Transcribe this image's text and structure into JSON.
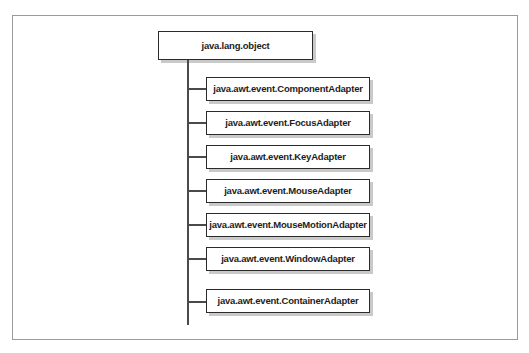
{
  "diagram": {
    "type": "class-hierarchy-tree",
    "root": {
      "label": "java.lang.object"
    },
    "children": [
      {
        "label": "java.awt.event.ComponentAdapter"
      },
      {
        "label": "java.awt.event.FocusAdapter"
      },
      {
        "label": "java.awt.event.KeyAdapter"
      },
      {
        "label": "java.awt.event.MouseAdapter"
      },
      {
        "label": "java.awt.event.MouseMotionAdapter"
      },
      {
        "label": "java.awt.event.WindowAdapter"
      },
      {
        "label": "java.awt.event.ContainerAdapter"
      }
    ],
    "colors": {
      "page_background": "#ffffff",
      "frame_border": "#9a9a9a",
      "node_border": "#2b2b2b",
      "node_fill": "#ffffff",
      "node_shadow": "#c9c9c9",
      "connector": "#4a4a4a",
      "text": "#1d1d1d"
    }
  }
}
